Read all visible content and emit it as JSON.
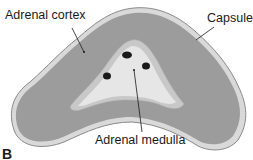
{
  "figure": {
    "panel_letter": "B",
    "labels": {
      "cortex": "Adrenal cortex",
      "capsule": "Capsule",
      "medulla": "Adrenal medulla"
    },
    "colors": {
      "capsule": "#d9d9d9",
      "capsule_edge": "#8a8a8a",
      "cortex": "#9c9c9c",
      "medulla_outer": "#c8c8c8",
      "medulla_inner": "#e6e6e6",
      "vessels": "#1a1a1a"
    }
  }
}
